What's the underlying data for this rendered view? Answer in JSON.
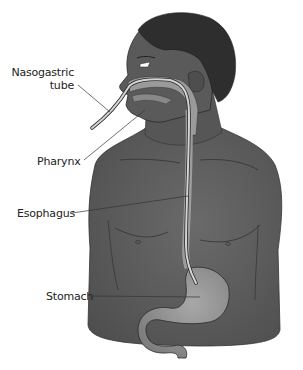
{
  "diagram": {
    "labels": [
      {
        "id": "nasogastric-tube",
        "line1": "Nasogastric",
        "line2": "tube"
      },
      {
        "id": "pharynx",
        "line1": "Pharynx"
      },
      {
        "id": "esophagus",
        "line1": "Esophagus"
      },
      {
        "id": "stomach",
        "line1": "Stomach"
      }
    ],
    "colors": {
      "skin": "#5e5e5e",
      "skin_dark": "#4a4a4a",
      "hair": "#2e2e2e",
      "airway": "#9a9a9a",
      "tube": "#c8c8c8",
      "stomach": "#8f8f8f",
      "leader_line": "#333333",
      "background": "#ffffff"
    }
  }
}
